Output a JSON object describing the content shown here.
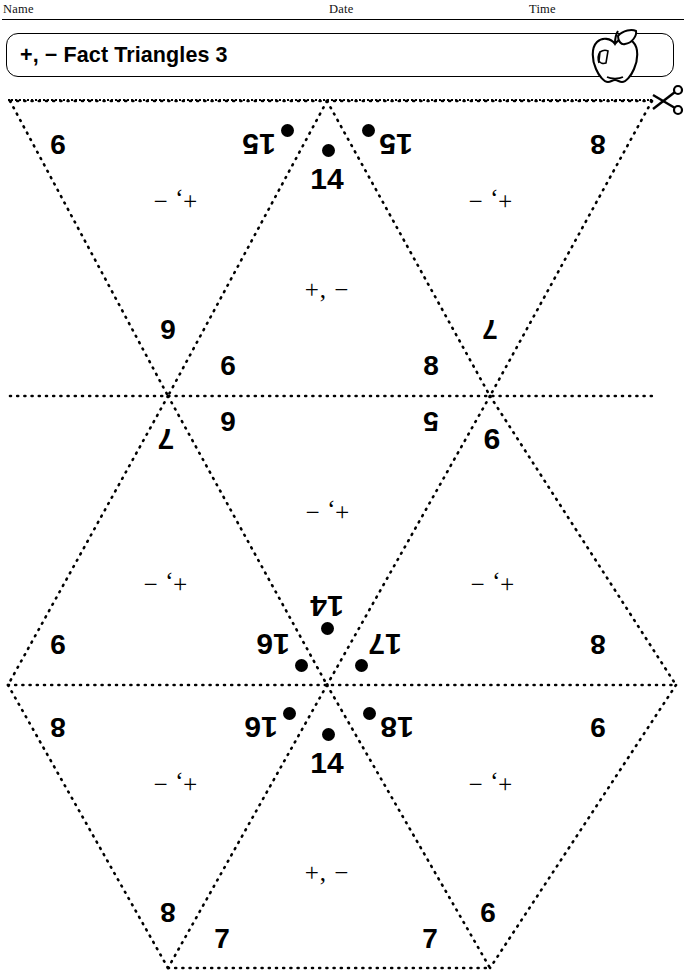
{
  "header": {
    "name_label": "Name",
    "date_label": "Date",
    "time_label": "Time",
    "title": "+, − Fact Triangles 3",
    "apple_icon": "apple-icon",
    "scissors_icon": "scissors-icon",
    "cut_line": "dotted-cut-line"
  },
  "page_number": "",
  "worksheet": {
    "operation_symbol": "+, −",
    "operation_symbol_reversed": "− ,+",
    "triangles": [
      {
        "id": "top-left",
        "orientation": "inverted",
        "rotated": true,
        "apex": "15",
        "apex_has_dot": true,
        "left_corner": "9",
        "right_corner": "6",
        "operation": "+, −"
      },
      {
        "id": "top-center",
        "orientation": "upright",
        "rotated": false,
        "apex": "14",
        "apex_has_dot": true,
        "left_corner": "6",
        "right_corner": "8",
        "operation": "+, −"
      },
      {
        "id": "top-right",
        "orientation": "inverted",
        "rotated": true,
        "apex": "15",
        "apex_has_dot": true,
        "left_corner": "7",
        "right_corner": "8",
        "operation": "+, −"
      },
      {
        "id": "middle-left",
        "orientation": "upright",
        "rotated": true,
        "apex": "7",
        "apex_has_dot": false,
        "left_corner": "16",
        "left_corner_has_dot": true,
        "right_corner": "9",
        "operation": "+, −"
      },
      {
        "id": "middle-center",
        "orientation": "inverted",
        "rotated": true,
        "apex": "14",
        "apex_has_dot": true,
        "left_corner": "5",
        "right_corner": "6",
        "operation": "+, −"
      },
      {
        "id": "middle-right",
        "orientation": "upright",
        "rotated": true,
        "apex": "9",
        "apex_has_dot": false,
        "left_corner": "8",
        "right_corner": "17",
        "right_corner_has_dot": true,
        "operation": "+, −"
      },
      {
        "id": "bottom-left",
        "orientation": "inverted",
        "rotated": true,
        "apex": "16",
        "apex_has_dot": true,
        "left_corner": "8",
        "right_corner": "8",
        "operation": "+, −"
      },
      {
        "id": "bottom-center",
        "orientation": "upright",
        "rotated": false,
        "apex": "14",
        "apex_has_dot": true,
        "left_corner": "7",
        "right_corner": "7",
        "operation": "+, −"
      },
      {
        "id": "bottom-right",
        "orientation": "inverted",
        "rotated": true,
        "apex": "18",
        "apex_has_dot": true,
        "left_corner": "9",
        "right_corner": "9",
        "operation": "+, −"
      }
    ]
  },
  "colors": {
    "ink": "#000000",
    "paper": "#ffffff"
  }
}
